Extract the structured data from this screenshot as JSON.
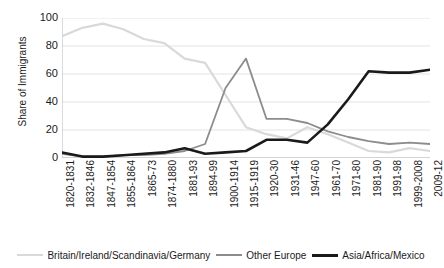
{
  "chart_data": {
    "type": "line",
    "title": "",
    "xlabel": "",
    "ylabel": "Share of Immigrants",
    "ylim": [
      0,
      100
    ],
    "yticks": [
      0,
      20,
      40,
      60,
      80,
      100
    ],
    "grid": true,
    "legend_position": "bottom",
    "categories": [
      "1820-1831",
      "1832-1846",
      "1847-1854",
      "1855-1864",
      "1865-73",
      "1874-1880",
      "1881-93",
      "1894-99",
      "1900-1914",
      "1915-1919",
      "1920-30",
      "1931-46",
      "1947-60",
      "1961-70",
      "1971-80",
      "1981-90",
      "1991-98",
      "1999-2008",
      "2009-12"
    ],
    "series": [
      {
        "name": "Britain/Ireland/Scandinavia/Germany",
        "color": "#d9d9d9",
        "width": 2.2,
        "values": [
          87,
          93,
          96,
          92,
          85,
          82,
          71,
          68,
          45,
          22,
          17,
          14,
          22,
          17,
          11,
          5,
          4,
          7,
          5
        ]
      },
      {
        "name": "Other Europe",
        "color": "#8c8c8c",
        "width": 1.8,
        "values": [
          3,
          1,
          1,
          2,
          2,
          3,
          5,
          10,
          50,
          71,
          28,
          28,
          25,
          19,
          15,
          12,
          10,
          11,
          10
        ]
      },
      {
        "name": "Asia/Africa/Mexico",
        "color": "#1a1a1a",
        "width": 2.6,
        "values": [
          4,
          1,
          1,
          2,
          3,
          4,
          7,
          3,
          4,
          5,
          13,
          13,
          11,
          24,
          42,
          62,
          61,
          61,
          63
        ]
      }
    ]
  },
  "legend": {
    "items": [
      {
        "label": "Britain/Ireland/Scandinavia/Germany",
        "color": "#d9d9d9",
        "thickness": "2px"
      },
      {
        "label": "Other Europe",
        "color": "#8c8c8c",
        "thickness": "2px"
      },
      {
        "label": "Asia/Africa/Mexico",
        "color": "#1a1a1a",
        "thickness": "3px"
      }
    ]
  },
  "axes": {
    "y_title": "Share of Immigrants"
  }
}
